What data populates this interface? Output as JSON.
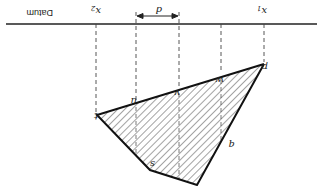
{
  "diagram": {
    "orientation": "rotated 180 degrees",
    "datum_label": "Datum",
    "width_label": "d",
    "labels": {
      "x1": "x",
      "x1_sub": "1",
      "x2": "x",
      "x2_sub": "2",
      "p": "p",
      "q": "q",
      "s": "s",
      "t": "t",
      "u": "u",
      "v": "v",
      "w": "w"
    },
    "colors": {
      "line": "#222222",
      "hatch": "#333333",
      "background": "#ffffff"
    }
  }
}
